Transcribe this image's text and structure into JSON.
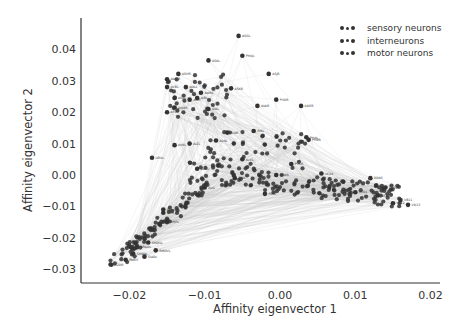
{
  "chart_data": {
    "type": "scatter",
    "title": "",
    "xlabel": "Affinity eigenvector 1",
    "ylabel": "Affinity eigenvector 2",
    "xlim": [
      -0.0262,
      0.0205
    ],
    "ylim": [
      -0.0335,
      0.0485
    ],
    "xticks": [
      -0.02,
      -0.01,
      0.0,
      0.01,
      0.02
    ],
    "xtick_labels": [
      "−0.02",
      "−0.01",
      "0.00",
      "0.01",
      "0.02"
    ],
    "yticks": [
      -0.03,
      -0.02,
      -0.01,
      0.0,
      0.01,
      0.02,
      0.03,
      0.04
    ],
    "ytick_labels": [
      "−0.03",
      "−0.02",
      "−0.01",
      "0.00",
      "0.01",
      "0.02",
      "0.03",
      "0.04"
    ],
    "grid": false,
    "legend_position": "upper right",
    "edges_color": "#c8c8c8",
    "point_color": "#333333",
    "series": [
      {
        "name": "sensory neurons",
        "points": [
          {
            "label": "ASGL",
            "x": -0.0055,
            "y": 0.0443
          },
          {
            "label": "PHQL",
            "x": -0.005,
            "y": 0.038
          },
          {
            "label": "ASKL",
            "x": -0.0095,
            "y": 0.0365
          },
          {
            "label": "ASJR",
            "x": -0.0015,
            "y": 0.0322
          },
          {
            "label": "ASKR",
            "x": -0.0065,
            "y": 0.0276
          },
          {
            "label": "ASHR",
            "x": -0.0135,
            "y": 0.0322
          },
          {
            "label": "AWCR",
            "x": -0.015,
            "y": 0.0305
          },
          {
            "label": "ADLL",
            "x": -0.0125,
            "y": 0.028
          },
          {
            "label": "ASEL",
            "x": -0.014,
            "y": 0.0245
          },
          {
            "label": "ASIR",
            "x": -0.012,
            "y": 0.024
          },
          {
            "label": "AWBL",
            "x": -0.0105,
            "y": 0.0262
          },
          {
            "label": "PVDR",
            "x": -0.0005,
            "y": 0.024
          },
          {
            "label": "ADER",
            "x": 0.0028,
            "y": 0.022
          },
          {
            "label": "AWAR",
            "x": -0.014,
            "y": 0.0215
          },
          {
            "label": "AFDL",
            "x": -0.015,
            "y": 0.02
          },
          {
            "label": "PHAL",
            "x": 0.0035,
            "y": 0.012
          },
          {
            "label": "PHBR",
            "x": 0.0038,
            "y": 0.0112
          },
          {
            "label": "ALNL",
            "x": -0.0085,
            "y": 0.011
          },
          {
            "label": "URXL",
            "x": -0.017,
            "y": 0.0055
          }
        ]
      },
      {
        "name": "interneurons",
        "points": [
          {
            "label": "AIBL",
            "x": -0.011,
            "y": 0.0245
          },
          {
            "label": "AIAL",
            "x": -0.0095,
            "y": 0.021
          },
          {
            "label": "AVAR",
            "x": -0.003,
            "y": 0.022
          },
          {
            "label": "AVBL",
            "x": -0.015,
            "y": 0.028
          },
          {
            "label": "RIBL",
            "x": -0.0035,
            "y": 0.014
          },
          {
            "label": "RIAR",
            "x": -0.007,
            "y": 0.0135
          },
          {
            "label": "AIZL",
            "x": -0.012,
            "y": 0.01
          },
          {
            "label": "AVKL",
            "x": -0.014,
            "y": 0.0095
          },
          {
            "label": "ADAR",
            "x": -0.0005,
            "y": 0.0
          },
          {
            "label": "RIGL",
            "x": -0.006,
            "y": -0.001
          },
          {
            "label": "AVDL",
            "x": -0.011,
            "y": 0.002
          },
          {
            "label": "PVCR",
            "x": 0.0015,
            "y": 0.0035
          },
          {
            "label": "AVEL",
            "x": -0.005,
            "y": 0.005
          },
          {
            "label": "RIML",
            "x": -0.0155,
            "y": -0.012
          },
          {
            "label": "AVG",
            "x": -0.01,
            "y": -0.004
          },
          {
            "label": "PVPL",
            "x": -0.002,
            "y": -0.006
          }
        ]
      },
      {
        "name": "motor neurons",
        "points": [
          {
            "label": "VC04",
            "x": 0.0055,
            "y": 0.0005
          },
          {
            "label": "VC01",
            "x": 0.01,
            "y": -0.0055
          },
          {
            "label": "VB11",
            "x": 0.016,
            "y": -0.008
          },
          {
            "label": "VA12",
            "x": 0.015,
            "y": -0.009
          },
          {
            "label": "DD05",
            "x": 0.012,
            "y": -0.001
          },
          {
            "label": "DA09",
            "x": 0.014,
            "y": -0.004
          },
          {
            "label": "VD13",
            "x": 0.017,
            "y": -0.0095
          },
          {
            "label": "AS11",
            "x": 0.013,
            "y": -0.0065
          },
          {
            "label": "SMDVL",
            "x": -0.0175,
            "y": -0.0215
          },
          {
            "label": "RMDVL",
            "x": -0.0165,
            "y": -0.024
          },
          {
            "label": "SMBDL",
            "x": -0.0195,
            "y": -0.025
          },
          {
            "label": "RMEV",
            "x": -0.0205,
            "y": -0.027
          },
          {
            "label": "SIADL",
            "x": -0.018,
            "y": -0.026
          },
          {
            "label": "RMHR",
            "x": -0.0155,
            "y": -0.011
          },
          {
            "label": "URADL",
            "x": -0.019,
            "y": -0.023
          },
          {
            "label": "IL2DR",
            "x": -0.0225,
            "y": -0.0285
          },
          {
            "label": "RMFL",
            "x": -0.015,
            "y": -0.015
          }
        ]
      }
    ]
  },
  "legend": {
    "items": [
      {
        "label": "sensory neurons"
      },
      {
        "label": "interneurons"
      },
      {
        "label": "motor neurons"
      }
    ]
  }
}
